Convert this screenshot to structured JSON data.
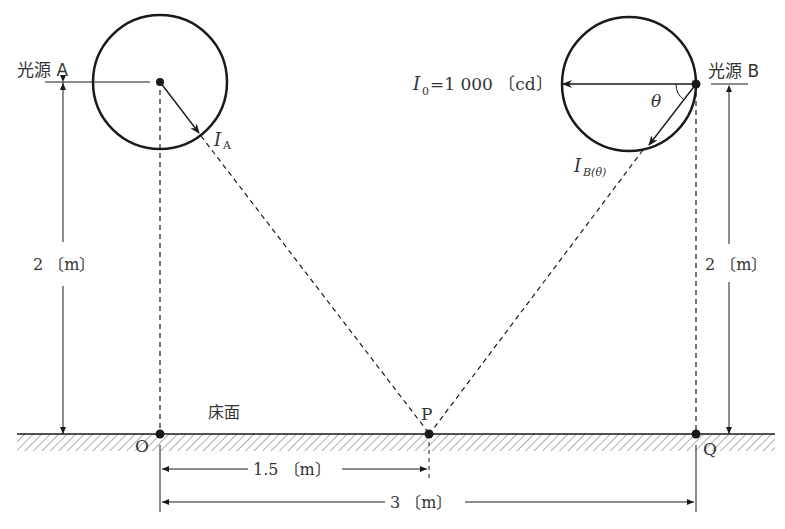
{
  "diagram": {
    "type": "illumination-geometry",
    "light_source_a": {
      "label": "光源 A",
      "intensity_label": "I",
      "intensity_sub": "A"
    },
    "light_source_b": {
      "label": "光源 B",
      "intensity_label": "I",
      "intensity_sub": "B(θ)",
      "angle_label": "θ"
    },
    "i0_label": {
      "symbol": "I",
      "sub": "0",
      "value": "=1 000 〔cd〕"
    },
    "floor_label": "床面",
    "points": {
      "o": "O",
      "p": "P",
      "q": "Q"
    },
    "dimensions": {
      "height_a": "2 〔m〕",
      "height_b": "2 〔m〕",
      "op": "1.5 〔m〕",
      "oq": "3 〔m〕"
    },
    "colors": {
      "line": "#1a1a1a",
      "text": "#333333",
      "hatch": "#777777"
    }
  }
}
